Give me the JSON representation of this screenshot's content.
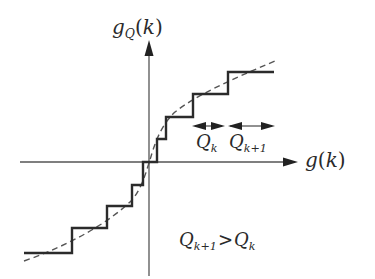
{
  "diagram": {
    "type": "quantizer-transfer-characteristic",
    "y_axis_label": {
      "base": "g",
      "sub": "Q",
      "arg": "k"
    },
    "x_axis_label": {
      "base": "g",
      "arg": "k"
    },
    "interval_labels": [
      {
        "base": "Q",
        "sub": "k"
      },
      {
        "base": "Q",
        "sub": "k+1"
      }
    ],
    "relation": {
      "left_base": "Q",
      "left_sub": "k+1",
      "operator": ">",
      "right_base": "Q",
      "right_sub": "k"
    },
    "colors": {
      "staircase": "#2b2b2b",
      "dashed_curve": "#555555",
      "axes": "#555555",
      "text": "#2a2a2a"
    }
  },
  "text": {
    "y_g": "g",
    "y_sub": "Q",
    "y_open": "(",
    "y_k": "k",
    "y_close": ")",
    "x_g": "g",
    "x_open": "(",
    "x_k": "k",
    "x_close": ")",
    "qk_Q": "Q",
    "qk_sub": "k",
    "qk1_Q": "Q",
    "qk1_sub": "k+1",
    "cmp_Q1": "Q",
    "cmp_sub1": "k+1",
    "cmp_op": ">",
    "cmp_Q2": "Q",
    "cmp_sub2": "k"
  }
}
